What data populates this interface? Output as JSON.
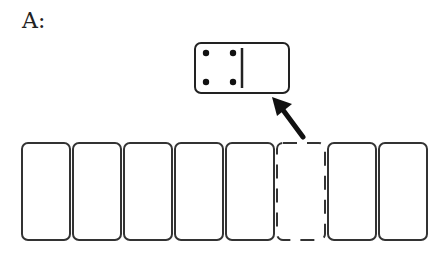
{
  "diagram": {
    "label": "A:",
    "domino": {
      "left_pips": 4,
      "right_pips": 0,
      "x": 195,
      "y": 43,
      "width": 94,
      "height": 50
    },
    "arrow": {
      "from": [
        305,
        140
      ],
      "to": [
        272,
        97
      ],
      "color": "#111111"
    },
    "tiles": [
      {
        "x": 22,
        "state": "solid"
      },
      {
        "x": 73,
        "state": "solid"
      },
      {
        "x": 124,
        "state": "solid"
      },
      {
        "x": 175,
        "state": "solid"
      },
      {
        "x": 226,
        "state": "solid"
      },
      {
        "x": 277,
        "state": "dashed"
      },
      {
        "x": 328,
        "state": "solid"
      },
      {
        "x": 379,
        "state": "solid"
      }
    ],
    "tile_size": {
      "width": 48,
      "height": 97,
      "y": 143
    },
    "stroke_color": "#333333"
  }
}
